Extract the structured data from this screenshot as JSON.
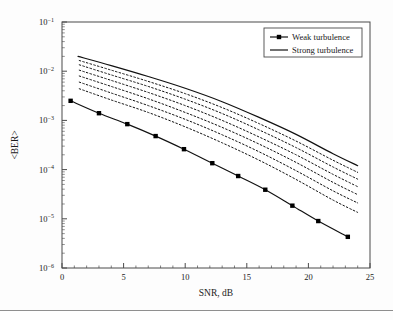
{
  "figure": {
    "background": "#fdfdfd",
    "frame_color": "#4a4a4a",
    "curve_color": "#111111",
    "marker_color": "#000000"
  },
  "chart_data": {
    "type": "line",
    "title": "",
    "xlabel": "SNR, dB",
    "ylabel": "<BER>",
    "xlim": [
      0,
      25
    ],
    "ylim": [
      1e-06,
      0.1
    ],
    "yscale": "log",
    "xscale": "linear",
    "grid": false,
    "legend_position": "top-right",
    "xticks": [
      0,
      5,
      10,
      15,
      20,
      25
    ],
    "xtick_labels": [
      "0",
      "5",
      "10",
      "15",
      "20",
      "25"
    ],
    "yticks": [
      0.1,
      0.01,
      0.001,
      0.0001,
      1e-05,
      1e-06
    ],
    "ytick_labels": [
      "10-1",
      "10-2",
      "10-3",
      "10-4",
      "10-5",
      "10-6"
    ],
    "ytick_mantissa": "10",
    "ytick_exponents": [
      "−1",
      "−2",
      "−3",
      "−4",
      "−5",
      "−6"
    ],
    "legend": [
      {
        "label": "Weak turbulence",
        "style": "line-marker",
        "marker": "square",
        "dash": "solid"
      },
      {
        "label": "Strong turbulence",
        "style": "line",
        "marker": "none",
        "dash": "solid"
      }
    ],
    "series": [
      {
        "name": "Weak turbulence",
        "style": "solid",
        "marker": "square",
        "x": [
          0.7,
          3.0,
          5.3,
          7.6,
          9.9,
          12.2,
          14.3,
          16.5,
          18.7,
          20.8,
          23.2
        ],
        "y": [
          0.0025,
          0.0014,
          0.00084,
          0.00048,
          0.00026,
          0.000135,
          7.4e-05,
          3.9e-05,
          1.85e-05,
          9e-06,
          4.3e-06
        ]
      },
      {
        "name": "Intermediate 1",
        "style": "dotted",
        "marker": "none",
        "x": [
          1.4,
          4.0,
          7.0,
          10.0,
          13.0,
          16.0,
          19.0,
          22.0,
          24.0
        ],
        "y": [
          0.0044,
          0.0026,
          0.00145,
          0.00074,
          0.00035,
          0.000155,
          6.3e-05,
          2.4e-05,
          1.35e-05
        ]
      },
      {
        "name": "Intermediate 2",
        "style": "dotted",
        "marker": "none",
        "x": [
          1.4,
          4.0,
          7.0,
          10.0,
          13.0,
          16.0,
          19.0,
          22.0,
          24.0
        ],
        "y": [
          0.006,
          0.0036,
          0.002,
          0.00105,
          0.00051,
          0.00023,
          9.5e-05,
          3.7e-05,
          2.1e-05
        ]
      },
      {
        "name": "Intermediate 3",
        "style": "dotted",
        "marker": "none",
        "x": [
          1.4,
          4.0,
          7.0,
          10.0,
          13.0,
          16.0,
          19.0,
          22.0,
          24.0
        ],
        "y": [
          0.008,
          0.0049,
          0.00275,
          0.00145,
          0.00072,
          0.00033,
          0.00014,
          5.5e-05,
          3.1e-05
        ]
      },
      {
        "name": "Intermediate 4",
        "style": "dotted",
        "marker": "none",
        "x": [
          1.4,
          4.0,
          7.0,
          10.0,
          13.0,
          16.0,
          19.0,
          22.0,
          24.0
        ],
        "y": [
          0.0105,
          0.0065,
          0.0037,
          0.002,
          0.001,
          0.00046,
          0.0002,
          8e-05,
          4.5e-05
        ]
      },
      {
        "name": "Intermediate 5",
        "style": "dotted",
        "marker": "none",
        "x": [
          1.4,
          4.0,
          7.0,
          10.0,
          13.0,
          16.0,
          19.0,
          22.0,
          24.0
        ],
        "y": [
          0.0135,
          0.0084,
          0.0049,
          0.0027,
          0.00138,
          0.00064,
          0.00028,
          0.000113,
          6.4e-05
        ]
      },
      {
        "name": "Intermediate 6",
        "style": "dotted",
        "marker": "none",
        "x": [
          1.4,
          4.0,
          7.0,
          10.0,
          13.0,
          16.0,
          19.0,
          22.0,
          24.0
        ],
        "y": [
          0.0165,
          0.0105,
          0.0062,
          0.0035,
          0.00182,
          0.00086,
          0.00038,
          0.000155,
          8.8e-05
        ]
      },
      {
        "name": "Strong turbulence",
        "style": "solid",
        "marker": "none",
        "x": [
          1.3,
          4.0,
          7.0,
          10.0,
          13.0,
          16.0,
          19.0,
          22.0,
          24.0
        ],
        "y": [
          0.02,
          0.013,
          0.0078,
          0.0045,
          0.0024,
          0.00115,
          0.00052,
          0.00021,
          0.00012
        ]
      }
    ]
  }
}
